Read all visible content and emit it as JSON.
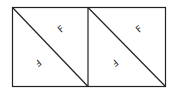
{
  "diagram": {
    "colors": {
      "stroke": "#222222",
      "background": "#ffffff"
    },
    "cells": [
      {
        "upper_label": "F",
        "lower_label": "F"
      },
      {
        "upper_label": "F",
        "lower_label": "F"
      }
    ]
  }
}
